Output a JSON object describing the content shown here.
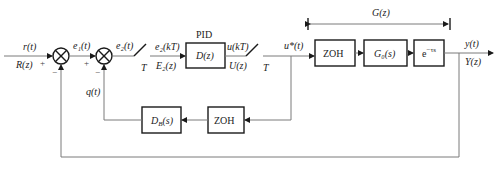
{
  "diagram": {
    "title_pid": "PID",
    "bracket_label": "G(z)",
    "input": {
      "time": "r(t)",
      "z": "R(z)",
      "sign": "+"
    },
    "junction1": {
      "feedback_sign": "−"
    },
    "e1": {
      "label": "e₁(t)",
      "sign": "+"
    },
    "junction2": {
      "feedback_sign": "−"
    },
    "e2": {
      "label": "e₂(t)"
    },
    "sampler1": {
      "period": "T"
    },
    "controller_in": {
      "time": "e₂(kT)",
      "z": "E₂(z)"
    },
    "controller": {
      "label": "D(z)"
    },
    "controller_out": {
      "time": "u(kT)",
      "z": "U(z)"
    },
    "sampler2": {
      "period": "T"
    },
    "ustar": {
      "label": "u*(t)"
    },
    "forward_blocks": [
      {
        "id": "zoh",
        "label": "ZOH"
      },
      {
        "id": "plant",
        "label": "G₀(s)"
      },
      {
        "id": "delay",
        "label": "e",
        "sup": "−τs"
      }
    ],
    "output": {
      "time": "y(t)",
      "z": "Y(z)"
    },
    "inner_feedback": {
      "signal": "q(t)",
      "blocks": [
        {
          "id": "zoh2",
          "label": "ZOH"
        },
        {
          "id": "db",
          "label": "D_B(s)"
        }
      ]
    },
    "colors": {
      "stroke": "#1a1a1a",
      "wire": "#7a7a7a",
      "background": "#ffffff"
    }
  }
}
